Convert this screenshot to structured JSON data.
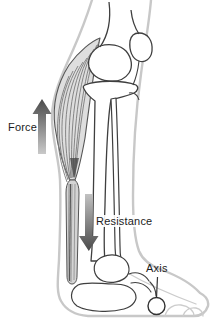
{
  "diagram": {
    "labels": {
      "force": "Force",
      "resistance": "Resistance",
      "axis": "Axis"
    },
    "markers": {
      "force_arrow_direction": "up",
      "resistance_arrow_direction": "down",
      "axis_marker_shape": "circle"
    },
    "colors": {
      "background": "#ffffff",
      "skin_outline": "#c8c8c8",
      "bone_outline": "#3f3f3f",
      "muscle_fill": "#dedede",
      "muscle_fiber": "#7a7a7a",
      "tendon_fill": "#d4d4d4",
      "arrow_gradient_dark": "#4a4a4a",
      "arrow_gradient_light": "#c9c9c9",
      "label_text": "#1c1c1c"
    }
  }
}
